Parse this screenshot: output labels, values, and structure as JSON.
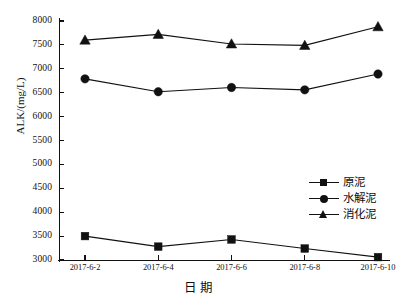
{
  "chart_data": {
    "type": "line",
    "title": "",
    "xlabel": "日期",
    "ylabel": "ALK/(mg/L)",
    "categories": [
      "2017-6-2",
      "2017-6-4",
      "2017-6-6",
      "2017-6-8",
      "2017-6-10"
    ],
    "ylim": [
      3000,
      8000
    ],
    "ytick_labels": [
      "3000",
      "3500",
      "4000",
      "4500",
      "5000",
      "5500",
      "6000",
      "6500",
      "7000",
      "7500",
      "8000"
    ],
    "ytick_values": [
      3000,
      3500,
      4000,
      4500,
      5000,
      5500,
      6000,
      6500,
      7000,
      7500,
      8000
    ],
    "grid": false,
    "legend_position": "center-right",
    "series": [
      {
        "name": "原泥",
        "marker": "square",
        "color": "#111111",
        "values": [
          3500,
          3280,
          3430,
          3240,
          3060
        ]
      },
      {
        "name": "水解泥",
        "marker": "circle",
        "color": "#111111",
        "values": [
          6790,
          6520,
          6610,
          6560,
          6890
        ]
      },
      {
        "name": "消化泥",
        "marker": "triangle",
        "color": "#111111",
        "values": [
          7600,
          7720,
          7520,
          7490,
          7880
        ]
      }
    ]
  }
}
